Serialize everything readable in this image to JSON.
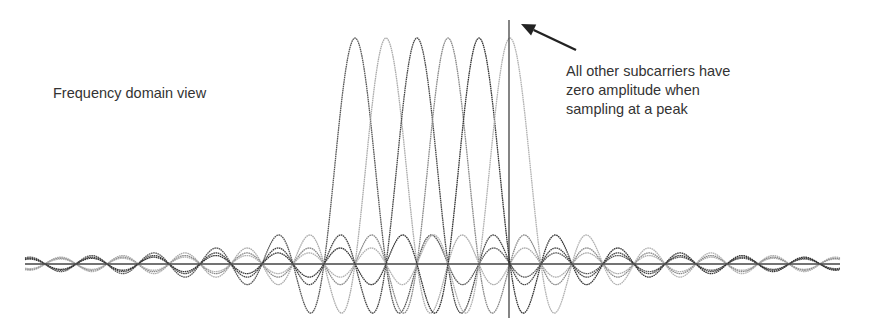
{
  "labels": {
    "view_title": "Frequency domain view",
    "annotation_lines": [
      "All other subcarriers have",
      "zero amplitude when",
      "sampling at a peak"
    ]
  },
  "chart_data": {
    "type": "line",
    "title": "Frequency domain view",
    "xlabel": "",
    "ylabel": "",
    "grid": false,
    "legend": null,
    "annotation": "All other subcarriers have zero amplitude when sampling at a peak",
    "series": [
      {
        "name": "subcarrier-1",
        "center_px": 355,
        "color": "#555555"
      },
      {
        "name": "subcarrier-2",
        "center_px": 386,
        "color": "#aaaaaa"
      },
      {
        "name": "subcarrier-3",
        "center_px": 417,
        "color": "#444444"
      },
      {
        "name": "subcarrier-4",
        "center_px": 448,
        "color": "#888888"
      },
      {
        "name": "subcarrier-5",
        "center_px": 479,
        "color": "#333333"
      },
      {
        "name": "subcarrier-6",
        "center_px": 510,
        "color": "#b0b0b0"
      }
    ],
    "layout": {
      "baseline_y": 264,
      "peak_y": 38,
      "x_start": 25,
      "x_end": 840,
      "null_spacing_px": 31,
      "sampling_line_x": 509,
      "sampling_line_top": 20,
      "sampling_line_bottom": 318
    }
  },
  "arrow": {
    "from": [
      576,
      50
    ],
    "to": [
      521,
      24
    ],
    "color": "#222222"
  }
}
